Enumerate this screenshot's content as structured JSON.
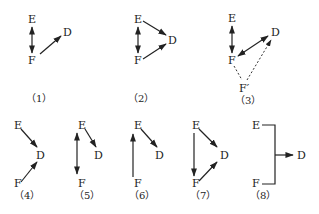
{
  "diagrams": [
    {
      "id": 1,
      "caption": "（1）",
      "nodes": {
        "E": "E",
        "F": "F",
        "D": "D"
      },
      "edges": [
        "E<->F",
        "F->D"
      ]
    },
    {
      "id": 2,
      "caption": "（2）",
      "nodes": {
        "E": "E",
        "F": "F",
        "D": "D"
      },
      "edges": [
        "E<->F",
        "E->D",
        "F->D"
      ]
    },
    {
      "id": 3,
      "caption": "（3）",
      "nodes": {
        "E": "E",
        "F": "F",
        "D": "D",
        "Fp": "F′"
      },
      "edges": [
        "E<->F",
        "F<->D",
        "F'..F (dashed)",
        "F'..>D (dashed)"
      ]
    },
    {
      "id": 4,
      "caption": "（4）",
      "nodes": {
        "E": "E",
        "F": "F",
        "D": "D"
      },
      "edges": [
        "E->D",
        "F->D"
      ]
    },
    {
      "id": 5,
      "caption": "（5）",
      "nodes": {
        "E": "E",
        "F": "F",
        "D": "D"
      },
      "edges": [
        "E<->F",
        "E->D"
      ]
    },
    {
      "id": 6,
      "caption": "（6）",
      "nodes": {
        "E": "E",
        "F": "F",
        "D": "D"
      },
      "edges": [
        "F->E",
        "E->D"
      ]
    },
    {
      "id": 7,
      "caption": "（7）",
      "nodes": {
        "E": "E",
        "F": "F",
        "D": "D"
      },
      "edges": [
        "E->F",
        "E->D",
        "F->D"
      ]
    },
    {
      "id": 8,
      "caption": "（8）",
      "nodes": {
        "E": "E",
        "F": "F",
        "D": "D"
      },
      "edges": [
        "E,F joint -> D"
      ]
    }
  ]
}
